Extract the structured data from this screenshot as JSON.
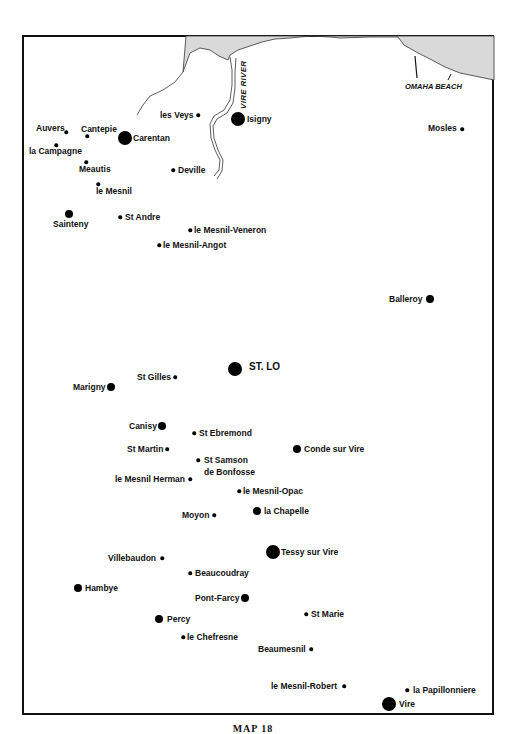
{
  "map": {
    "caption": "MAP 18",
    "colors": {
      "sea": "#d9d9d9",
      "ink": "#111111",
      "background": "#ffffff"
    },
    "features": {
      "river_label": "VIRE RIVER",
      "beach_label": "OMAHA BEACH"
    },
    "places": [
      {
        "name": "les Veys",
        "size": "s",
        "x": 198,
        "y": 115,
        "lx": 160,
        "ly": 110,
        "anchor": "left-of-dot"
      },
      {
        "name": "Isigny",
        "size": "l",
        "x": 238,
        "y": 119,
        "lx": 247,
        "ly": 114
      },
      {
        "name": "Auvers",
        "size": "s",
        "x": 66,
        "y": 132,
        "lx": 36,
        "ly": 123
      },
      {
        "name": "Cantepie",
        "size": "s",
        "x": 87,
        "y": 136,
        "lx": 81,
        "ly": 124
      },
      {
        "name": "Carentan",
        "size": "l",
        "x": 125,
        "y": 138,
        "lx": 133,
        "ly": 133
      },
      {
        "name": "la Campagne",
        "size": "s",
        "x": 56,
        "y": 145,
        "lx": 29,
        "ly": 146
      },
      {
        "name": "Meautis",
        "size": "s",
        "x": 86,
        "y": 162,
        "lx": 79,
        "ly": 164
      },
      {
        "name": "Deville",
        "size": "s",
        "x": 173,
        "y": 170,
        "lx": 178,
        "ly": 165
      },
      {
        "name": "le Mesnil",
        "size": "s",
        "x": 98,
        "y": 184,
        "lx": 96,
        "ly": 186
      },
      {
        "name": "Sainteny",
        "size": "m",
        "x": 69,
        "y": 214,
        "lx": 53,
        "ly": 219
      },
      {
        "name": "St Andre",
        "size": "s",
        "x": 120,
        "y": 217,
        "lx": 125,
        "ly": 212
      },
      {
        "name": "le Mesnil-Veneron",
        "size": "s",
        "x": 190,
        "y": 230,
        "lx": 194,
        "ly": 225
      },
      {
        "name": "le Mesnil-Angot",
        "size": "s",
        "x": 159,
        "y": 245,
        "lx": 163,
        "ly": 240
      },
      {
        "name": "Mosles",
        "size": "s",
        "x": 462,
        "y": 129,
        "lx": 428,
        "ly": 123
      },
      {
        "name": "Balleroy",
        "size": "m",
        "x": 430,
        "y": 299,
        "lx": 389,
        "ly": 294
      },
      {
        "name": "ST. LO",
        "size": "l",
        "x": 235,
        "y": 369,
        "lx": 249,
        "ly": 362,
        "big": true
      },
      {
        "name": "St Gilles",
        "size": "s",
        "x": 175,
        "y": 377,
        "lx": 137,
        "ly": 372
      },
      {
        "name": "Marigny",
        "size": "m",
        "x": 111,
        "y": 387,
        "lx": 73,
        "ly": 382
      },
      {
        "name": "Canisy",
        "size": "m",
        "x": 162,
        "y": 426,
        "lx": 129,
        "ly": 421
      },
      {
        "name": "St Ebremond",
        "size": "s",
        "x": 194,
        "y": 433,
        "lx": 199,
        "ly": 428
      },
      {
        "name": "St Martin",
        "size": "s",
        "x": 167,
        "y": 449,
        "lx": 127,
        "ly": 444
      },
      {
        "name": "Conde sur Vire",
        "size": "m",
        "x": 297,
        "y": 449,
        "lx": 304,
        "ly": 444
      },
      {
        "name": "St Samson",
        "size": "s",
        "x": 198,
        "y": 460,
        "lx": 204,
        "ly": 455
      },
      {
        "name": "de Bonfosse",
        "size": "none",
        "lx": 204,
        "ly": 467
      },
      {
        "name": "le Mesnil Herman",
        "size": "s",
        "x": 190,
        "y": 479,
        "lx": 115,
        "ly": 474
      },
      {
        "name": "le Mesnil-Opac",
        "size": "s",
        "x": 239,
        "y": 491,
        "lx": 243,
        "ly": 486
      },
      {
        "name": "Moyon",
        "size": "s",
        "x": 214,
        "y": 515,
        "lx": 182,
        "ly": 510
      },
      {
        "name": "la Chapelle",
        "size": "m",
        "x": 257,
        "y": 511,
        "lx": 264,
        "ly": 506
      },
      {
        "name": "Tessy sur Vire",
        "size": "l",
        "x": 273,
        "y": 552,
        "lx": 281,
        "ly": 547
      },
      {
        "name": "Villebaudon",
        "size": "s",
        "x": 162,
        "y": 558,
        "lx": 108,
        "ly": 553
      },
      {
        "name": "Beaucoudray",
        "size": "s",
        "x": 190,
        "y": 573,
        "lx": 195,
        "ly": 568
      },
      {
        "name": "Hambye",
        "size": "m",
        "x": 78,
        "y": 588,
        "lx": 85,
        "ly": 583
      },
      {
        "name": "Pont-Farcy",
        "size": "m",
        "x": 245,
        "y": 598,
        "lx": 195,
        "ly": 593
      },
      {
        "name": "St Marie",
        "size": "s",
        "x": 306,
        "y": 614,
        "lx": 311,
        "ly": 609
      },
      {
        "name": "Percy",
        "size": "m",
        "x": 159,
        "y": 619,
        "lx": 167,
        "ly": 614
      },
      {
        "name": "le Chefresne",
        "size": "s",
        "x": 183,
        "y": 637,
        "lx": 187,
        "ly": 632
      },
      {
        "name": "Beaumesnil",
        "size": "s",
        "x": 311,
        "y": 649,
        "lx": 258,
        "ly": 644
      },
      {
        "name": "le Mesnil-Robert",
        "size": "s",
        "x": 344,
        "y": 686,
        "lx": 271,
        "ly": 681
      },
      {
        "name": "la Papillonniere",
        "size": "s",
        "x": 407,
        "y": 690,
        "lx": 413,
        "ly": 685
      },
      {
        "name": "Vire",
        "size": "l",
        "x": 389,
        "y": 704,
        "lx": 399,
        "ly": 699
      }
    ]
  }
}
